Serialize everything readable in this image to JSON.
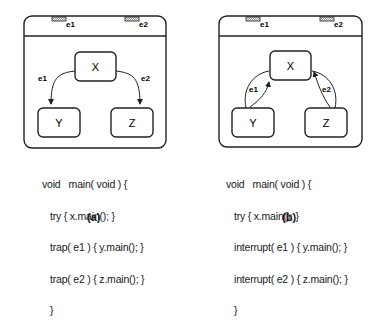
{
  "panels": [
    {
      "id": "a",
      "caption": "(a)",
      "events": [
        "e1",
        "e2"
      ],
      "states": {
        "top": "X",
        "left": "Y",
        "right": "Z"
      },
      "transitions": [
        {
          "label": "e1",
          "from": "X",
          "to": "Y"
        },
        {
          "label": "e2",
          "from": "X",
          "to": "Z"
        }
      ],
      "code": {
        "line1": "void   main( void ) {",
        "line2": "try { x.main(); }",
        "line3": "trap( e1 ) { y.main(); }",
        "line4": "trap( e2 ) { z.main(); }",
        "line5": "}"
      }
    },
    {
      "id": "b",
      "caption": "(b)",
      "events": [
        "e1",
        "e2"
      ],
      "states": {
        "top": "X",
        "left": "Y",
        "right": "Z"
      },
      "transitions": [
        {
          "label": "e1",
          "from": "X",
          "to": "Y"
        },
        {
          "label": "e1",
          "from": "Y",
          "to": "X"
        },
        {
          "label": "e2",
          "from": "X",
          "to": "Z"
        },
        {
          "label": "e2",
          "from": "Z",
          "to": "X"
        }
      ],
      "code": {
        "line1": "void   main( void ) {",
        "line2": "try { x.main(); }",
        "line3": "interrupt( e1 ) { y.main(); }",
        "line4": "interrupt( e2 ) { z.main(); }",
        "line5": "}"
      }
    }
  ]
}
